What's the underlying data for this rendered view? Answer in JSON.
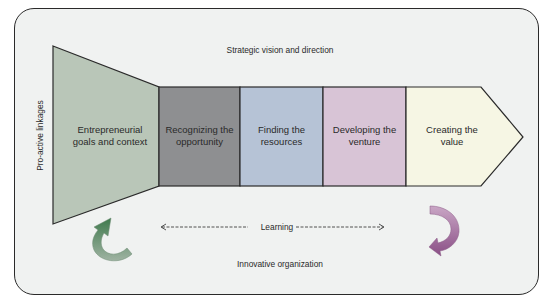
{
  "diagram": {
    "top_label": "Strategic vision and direction",
    "bottom_label": "Innovative organization",
    "side_label": "Pro-active linkages",
    "learning_label": "Learning",
    "stages": [
      {
        "line1": "Entrepreneurial",
        "line2": "goals and context",
        "color": "#b9c6b8"
      },
      {
        "line1": "Recognizing the",
        "line2": "opportunity",
        "color": "#8e8f91"
      },
      {
        "line1": "Finding the",
        "line2": "resources",
        "color": "#b6c3d6"
      },
      {
        "line1": "Developing the",
        "line2": "venture",
        "color": "#d8c4d6"
      },
      {
        "line1": "Creating the",
        "line2": "value",
        "color": "#f6f6e4"
      }
    ],
    "colors": {
      "frame_bg": "#f0f2f1",
      "outline": "#2a2a2a",
      "green_arrow": "#4e7c5a",
      "purple_arrow": "#9a6493"
    }
  }
}
